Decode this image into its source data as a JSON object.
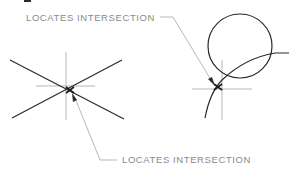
{
  "figure": {
    "labels": {
      "top": "LOCATES INTERSECTION",
      "bottom": "LOCATES INTERSECTION"
    },
    "colors": {
      "line_dark": "#2a2a2a",
      "line_light": "#9a9a9a",
      "text": "#8a8a8a",
      "background": "#ffffff"
    },
    "left_figure": {
      "description": "Two intersecting lines with crosshair locating intersection",
      "intersection": [
        70,
        90
      ]
    },
    "right_figure": {
      "description": "Circle and arc with crosshair locating intersection",
      "intersection": [
        218,
        87
      ]
    }
  }
}
